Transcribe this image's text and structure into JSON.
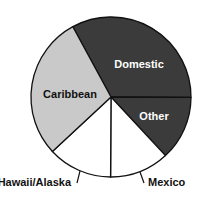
{
  "chart_data": {
    "type": "pie",
    "title": "",
    "categories": [
      "Domestic",
      "Other",
      "Mexico",
      "Hawaii/Alaska",
      "Caribbean"
    ],
    "values": [
      33,
      13,
      12,
      13,
      29
    ],
    "unit": "percent (estimated from slice angles)",
    "colors": [
      "#3b3b3b",
      "#3b3b3b",
      "#ffffff",
      "#ffffff",
      "#c9c9c9"
    ],
    "label_colors": [
      "#ffffff",
      "#ffffff",
      "#111111",
      "#111111",
      "#111111"
    ],
    "label_placement": [
      "inside",
      "inside",
      "outside",
      "outside",
      "inside"
    ],
    "start_angle_deg": -118.5,
    "direction": "clockwise",
    "legend": "none"
  },
  "labels": {
    "domestic": "Domestic",
    "other": "Other",
    "mexico": "Mexico",
    "hawaii_alaska": "Hawaii/Alaska",
    "caribbean": "Caribbean"
  }
}
